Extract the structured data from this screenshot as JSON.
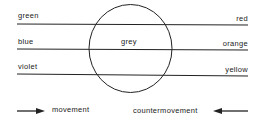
{
  "diagram": {
    "left_labels": [
      "green",
      "blue",
      "violet"
    ],
    "right_labels": [
      "red",
      "orange",
      "yellow"
    ],
    "center_label": "grey",
    "legend": {
      "movement": "movement",
      "countermovement": "countermovement"
    },
    "colors": {
      "line": "#222222",
      "background": "#ffffff"
    }
  }
}
